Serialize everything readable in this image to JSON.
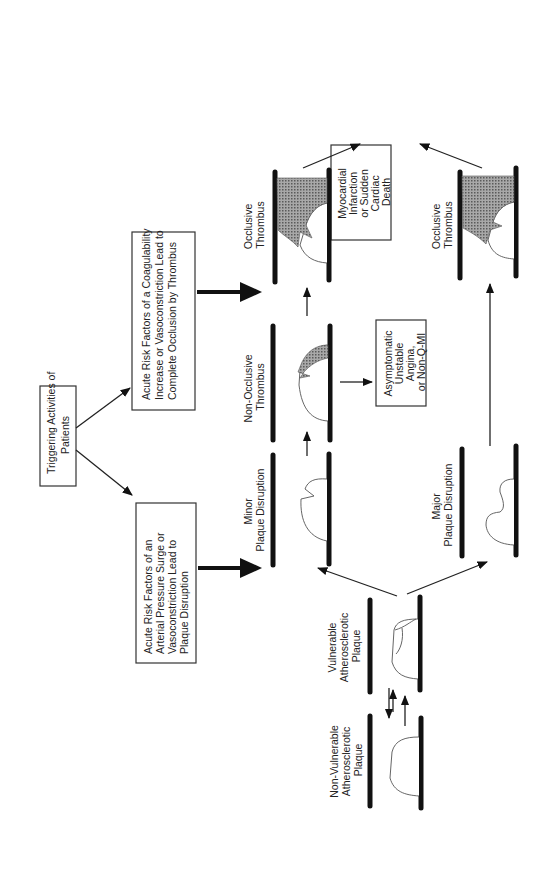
{
  "diagram": {
    "orientation": "rotated 90 degrees counter-clockwise",
    "nodes": {
      "trigger": {
        "lines": [
          "Triggering Activities of",
          "Patients"
        ]
      },
      "coagulability": {
        "lines": [
          "Acute Risk Factors of a Coagulability",
          "Increase or Vasoconstriction Lead to",
          "Complete Occlusion by Thrombus"
        ]
      },
      "pressure": {
        "lines": [
          "Acute Risk Factors of  an",
          "Arterial Pressure Surge or",
          "Vasoconstriction Lead to",
          "Plaque Disruption"
        ]
      },
      "non_vulnerable": {
        "lines": [
          "Non-Vulnerable",
          "Atherosclerotic",
          "Plaque"
        ]
      },
      "vulnerable": {
        "lines": [
          "Vulnerable",
          "Atherosclerotic",
          "Plaque"
        ]
      },
      "minor": {
        "lines": [
          "Minor",
          "Plaque Disruption"
        ]
      },
      "major": {
        "lines": [
          "Major",
          "Plaque Disruption"
        ]
      },
      "non_occlusive": {
        "lines": [
          "Non-Occlusive",
          "Thrombus"
        ]
      },
      "occlusive_top": {
        "lines": [
          "Occlusive",
          "Thrombus"
        ]
      },
      "occlusive_bottom": {
        "lines": [
          "Occlusive",
          "Thrombus"
        ]
      },
      "asymptomatic": {
        "lines": [
          "Asymptomatic",
          "Unstable",
          "Angina,",
          "or Non-Q-MI"
        ]
      },
      "outcome": {
        "lines": [
          "Myocardial",
          "Infarction",
          "or Sudden",
          "Cardiac",
          "Death"
        ]
      }
    },
    "edges": [
      {
        "from": "trigger",
        "to": "coagulability",
        "style": "thin"
      },
      {
        "from": "trigger",
        "to": "pressure",
        "style": "thin"
      },
      {
        "from": "coagulability",
        "to": "non_occlusive/occlusive_top",
        "style": "thick"
      },
      {
        "from": "pressure",
        "to": "minor/vulnerable",
        "style": "thick"
      },
      {
        "from": "non_vulnerable",
        "to": "vulnerable",
        "style": "thin"
      },
      {
        "from": "vulnerable",
        "to": "non_vulnerable",
        "style": "thin"
      },
      {
        "from": "vulnerable",
        "to": "minor",
        "style": "thin"
      },
      {
        "from": "vulnerable",
        "to": "major",
        "style": "thin"
      },
      {
        "from": "minor",
        "to": "non_occlusive",
        "style": "thin"
      },
      {
        "from": "non_occlusive",
        "to": "occlusive_top",
        "style": "thin"
      },
      {
        "from": "non_occlusive",
        "to": "asymptomatic",
        "style": "thin"
      },
      {
        "from": "major",
        "to": "occlusive_bottom",
        "style": "thin"
      },
      {
        "from": "occlusive_top",
        "to": "outcome",
        "style": "thin"
      },
      {
        "from": "occlusive_bottom",
        "to": "outcome",
        "style": "thin"
      }
    ],
    "colors": {
      "line": "#111111",
      "box_border": "#333333",
      "thrombus_fill": "#8a8a8a",
      "background": "#ffffff"
    }
  }
}
